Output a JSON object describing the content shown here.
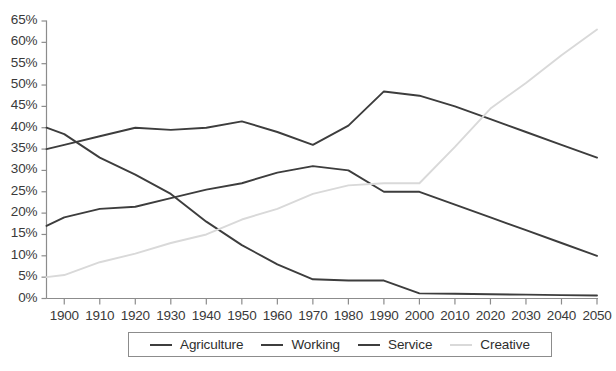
{
  "chart_data": {
    "type": "line",
    "title": "",
    "subtitle": "",
    "xlabel": "",
    "ylabel": "",
    "grid": false,
    "legend_position": "bottom-center",
    "x": [
      1895,
      1900,
      1910,
      1920,
      1930,
      1940,
      1950,
      1960,
      1970,
      1980,
      1990,
      2000,
      2010,
      2020,
      2030,
      2040,
      2050
    ],
    "xlim": [
      1895,
      2050
    ],
    "ylim": [
      0,
      65
    ],
    "ytick_values": [
      0,
      5,
      10,
      15,
      20,
      25,
      30,
      35,
      40,
      45,
      50,
      55,
      60,
      65
    ],
    "ytick_labels": [
      "0%",
      "5%",
      "10%",
      "15%",
      "20%",
      "25%",
      "30%",
      "35%",
      "40%",
      "45%",
      "50%",
      "55%",
      "60%",
      "65%"
    ],
    "xtick_values": [
      1900,
      1910,
      1920,
      1930,
      1940,
      1950,
      1960,
      1970,
      1980,
      1990,
      2000,
      2010,
      2020,
      2030,
      2040,
      2050
    ],
    "xtick_labels": [
      "1900",
      "1910",
      "1920",
      "1930",
      "1940",
      "1950",
      "1960",
      "1970",
      "1980",
      "1990",
      "2000",
      "2010",
      "2020",
      "2030",
      "2040",
      "2050"
    ],
    "series": [
      {
        "name": "Agriculture",
        "color": "#3d3d3d",
        "values": [
          40.0,
          38.5,
          33.0,
          29.0,
          24.5,
          18.0,
          12.5,
          8.0,
          4.5,
          4.2,
          4.2,
          1.2,
          1.1,
          1.0,
          0.9,
          0.8,
          0.7
        ]
      },
      {
        "name": "Working",
        "color": "#3d3d3d",
        "values": [
          17.0,
          19.0,
          21.0,
          21.5,
          23.5,
          25.5,
          27.0,
          29.5,
          31.0,
          30.0,
          25.0,
          25.0,
          22.0,
          19.0,
          16.0,
          13.0,
          10.0
        ]
      },
      {
        "name": "Service",
        "color": "#3d3d3d",
        "values": [
          35.0,
          36.0,
          38.0,
          40.0,
          39.5,
          40.0,
          41.5,
          39.0,
          36.0,
          40.5,
          48.5,
          47.5,
          45.0,
          42.0,
          39.0,
          36.0,
          33.0
        ]
      },
      {
        "name": "Creative",
        "color": "#d9d9d9",
        "values": [
          5.0,
          5.5,
          8.5,
          10.5,
          13.0,
          15.0,
          18.5,
          21.0,
          24.5,
          26.5,
          27.0,
          27.0,
          35.5,
          44.5,
          50.5,
          57.0,
          63.0
        ]
      }
    ]
  },
  "legend": {
    "items": [
      {
        "label": "Agriculture",
        "color": "#3d3d3d"
      },
      {
        "label": "Working",
        "color": "#3d3d3d"
      },
      {
        "label": "Service",
        "color": "#3d3d3d"
      },
      {
        "label": "Creative",
        "color": "#d9d9d9"
      }
    ]
  },
  "axes": {
    "axis_color": "#8c8c8c",
    "tick_color": "#8c8c8c",
    "label_color": "#3a3a3a"
  }
}
